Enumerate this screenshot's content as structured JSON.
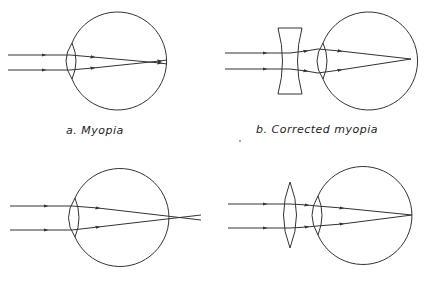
{
  "diagram": {
    "stroke_color": "#333333",
    "panels": [
      {
        "id": "a",
        "label": "a. Myopia",
        "lens_correction": "none",
        "focus": "in front of retina"
      },
      {
        "id": "b",
        "label": "b. Corrected myopia",
        "lens_correction": "concave lens",
        "focus": "on retina"
      },
      {
        "id": "c",
        "label": "",
        "lens_correction": "none",
        "focus": "behind retina"
      },
      {
        "id": "d",
        "label": "",
        "lens_correction": "convex lens",
        "focus": "on retina"
      }
    ]
  }
}
